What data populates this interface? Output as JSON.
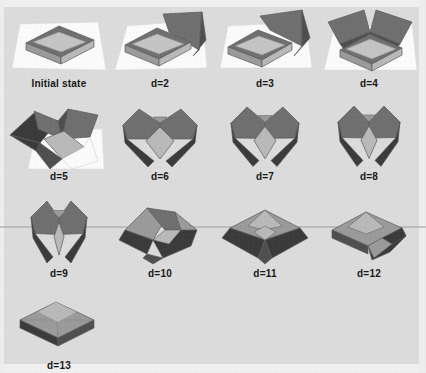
{
  "figure": {
    "background_color": "#dcdcdc",
    "plate_border_color": "#f0f0f0",
    "label_color": "#161616",
    "columns": 4,
    "rows": 4
  },
  "palette": {
    "paper_white": "#fbfbfb",
    "paper_white_shadow": "#e6e6e6",
    "face_light": "#b9b9b9",
    "face_mid": "#9a9a9a",
    "face_dark": "#6f6f6f",
    "face_darker": "#4e4e4e",
    "face_darkest": "#3a3a3a",
    "edge_line": "#5a5a5a",
    "inner_top": "#c4c4c4"
  },
  "panels": [
    {
      "id": "initial-state",
      "label": "Initial state",
      "col": 0,
      "row": 0,
      "has_ground_sheet": true,
      "stage": 1
    },
    {
      "id": "d-2",
      "label": "d=2",
      "col": 1,
      "row": 0,
      "has_ground_sheet": true,
      "stage": 2
    },
    {
      "id": "d-3",
      "label": "d=3",
      "col": 2,
      "row": 0,
      "has_ground_sheet": true,
      "stage": 3
    },
    {
      "id": "d-4",
      "label": "d=4",
      "col": 3,
      "row": 0,
      "has_ground_sheet": true,
      "stage": 4
    },
    {
      "id": "d-5",
      "label": "d=5",
      "col": 0,
      "row": 1,
      "has_ground_sheet": true,
      "stage": 5
    },
    {
      "id": "d-6",
      "label": "d=6",
      "col": 1,
      "row": 1,
      "has_ground_sheet": false,
      "stage": 6
    },
    {
      "id": "d-7",
      "label": "d=7",
      "col": 2,
      "row": 1,
      "has_ground_sheet": false,
      "stage": 7
    },
    {
      "id": "d-8",
      "label": "d=8",
      "col": 3,
      "row": 1,
      "has_ground_sheet": false,
      "stage": 8
    },
    {
      "id": "d-9",
      "label": "d=9",
      "col": 0,
      "row": 2,
      "has_ground_sheet": false,
      "stage": 9
    },
    {
      "id": "d-10",
      "label": "d=10",
      "col": 1,
      "row": 2,
      "has_ground_sheet": false,
      "stage": 10
    },
    {
      "id": "d-11",
      "label": "d=11",
      "col": 2,
      "row": 2,
      "has_ground_sheet": false,
      "stage": 11
    },
    {
      "id": "d-12",
      "label": "d=12",
      "col": 3,
      "row": 2,
      "has_ground_sheet": false,
      "stage": 12
    },
    {
      "id": "d-13",
      "label": "d=13",
      "col": 0,
      "row": 3,
      "has_ground_sheet": false,
      "stage": 13
    }
  ]
}
